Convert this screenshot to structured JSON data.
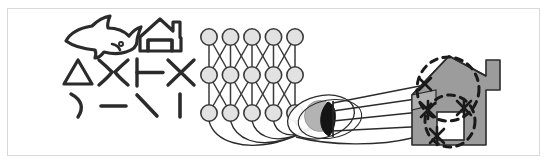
{
  "figure": {
    "canvas": {
      "width": 547,
      "height": 165,
      "background": "#ffffff"
    },
    "border": {
      "color": "#d9d9d9",
      "width": 1,
      "x": 7,
      "y": 8,
      "w": 533,
      "h": 148
    }
  },
  "palette": {
    "ink": "#2b2b2b",
    "stroke_dark": "#1f1f1f",
    "node_fill": "#e2e2e2",
    "node_stroke": "#3a3a3a",
    "lens_fill": "#ffffff",
    "lens_stroke": "#2b2b2b",
    "pupil_fill": "#b3b3b3",
    "pupil_dark": "#141414",
    "house_fill": "#9c9c9c",
    "house_stroke": "#2b2b2b",
    "window_fill": "#ffffff",
    "dashed_stroke": "#1a1a1a",
    "border": "#d9d9d9"
  },
  "shape_bank": {
    "label": "visual feature primitives",
    "rows": [
      {
        "row_index": 0,
        "items": [
          {
            "name": "shark-outline",
            "glyph": "shark",
            "cx": 95,
            "cy": 35
          },
          {
            "name": "house-outline",
            "glyph": "house",
            "cx": 160,
            "cy": 34
          }
        ]
      },
      {
        "row_index": 1,
        "items": [
          {
            "name": "triangle-shape",
            "glyph": "triangle",
            "cx": 78,
            "cy": 73
          },
          {
            "name": "bowtie-shape",
            "glyph": "bowtie",
            "cx": 113,
            "cy": 72
          },
          {
            "name": "tee-shape",
            "glyph": "tee",
            "cx": 148,
            "cy": 72
          },
          {
            "name": "cross-shape",
            "glyph": "cross",
            "cx": 181,
            "cy": 72
          }
        ]
      },
      {
        "row_index": 2,
        "items": [
          {
            "name": "arc-stroke",
            "glyph": "arc",
            "cx": 76,
            "cy": 106
          },
          {
            "name": "dash-stroke",
            "glyph": "dash",
            "cx": 113,
            "cy": 106
          },
          {
            "name": "backslash-stroke",
            "glyph": "backslash",
            "cx": 147,
            "cy": 105
          },
          {
            "name": "vertical-bar-stroke",
            "glyph": "bar",
            "cx": 180,
            "cy": 105
          }
        ]
      }
    ]
  },
  "network": {
    "label": "layered node lattice",
    "columns": 5,
    "rows": 3,
    "node_radius": 8.2,
    "x_start": 209,
    "x_step": 21.5,
    "y_rows": [
      37,
      75,
      113
    ],
    "connection_style": "vertical-and-crossing-diagonals"
  },
  "projection": {
    "label": "fan of curved fibers from bottom node row into the lens",
    "fiber_count": 5,
    "source_row": 2,
    "target": "lens"
  },
  "lens": {
    "name": "eye-lens",
    "cx": 321,
    "cy": 117,
    "rx": 34,
    "ry": 21,
    "rotation": -14,
    "pupil_cx": 320,
    "pupil_cy": 116,
    "pupil_r": 15,
    "aperture_label": "dark aperture crescent"
  },
  "scene": {
    "name": "target-house-object",
    "house_fill": "#9c9c9c",
    "window": {
      "x": 437,
      "y": 112,
      "w": 27,
      "h": 28
    },
    "chimney": {
      "x": 486,
      "y": 60,
      "w": 14,
      "h": 30
    },
    "receptive_fields": [
      {
        "name": "receptive-field-upper",
        "cx": 448,
        "cy": 89,
        "rx": 31,
        "ry": 32
      },
      {
        "name": "receptive-field-lower",
        "cx": 450,
        "cy": 120,
        "rx": 25,
        "ry": 26
      }
    ],
    "feature_markers": [
      {
        "name": "feature-marker-a",
        "cx": 428,
        "cy": 110,
        "size": 9
      },
      {
        "name": "feature-marker-b",
        "cx": 464,
        "cy": 108,
        "size": 9
      },
      {
        "name": "feature-marker-c",
        "cx": 437,
        "cy": 136,
        "size": 9
      },
      {
        "name": "feature-marker-d",
        "cx": 425,
        "cy": 84,
        "size": 7
      }
    ]
  }
}
